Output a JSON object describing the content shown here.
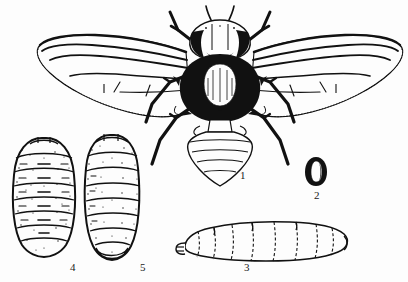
{
  "plate": {
    "title": "Life stages of a fly",
    "background_color": "#fdfdfd",
    "ink_color": "#111111",
    "width": 408,
    "height": 282,
    "figures": [
      {
        "number": "1",
        "name": "adult-fly",
        "description": "Adult fly, dorsal view, wings spread, black thorax and abdomen with banded abdomen",
        "label_x": 240,
        "label_y": 170
      },
      {
        "number": "2",
        "name": "egg",
        "description": "Egg, small dark elongate oval with pale median line",
        "label_x": 314,
        "label_y": 190
      },
      {
        "number": "3",
        "name": "larva",
        "description": "Larva (maggot), lateral view, segmented tapering body with mouth hooks at anterior end",
        "label_x": 244,
        "label_y": 262
      },
      {
        "number": "4",
        "name": "puparium-dorsal",
        "description": "Puparium, dorsal view, oval stippled body with transverse segment lines",
        "label_x": 70,
        "label_y": 262
      },
      {
        "number": "5",
        "name": "puparium-lateral",
        "description": "Puparium, lateral view, elongate stippled body with transverse segment lines",
        "label_x": 140,
        "label_y": 262
      }
    ]
  }
}
